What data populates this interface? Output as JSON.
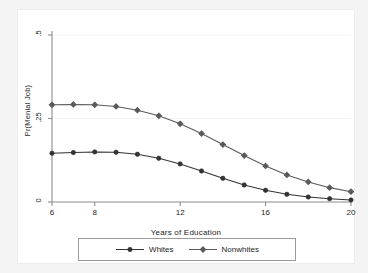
{
  "chart_data": {
    "type": "line",
    "title": "",
    "xlabel": "Years of Education",
    "ylabel": "Pr(Menial Job)",
    "xlim": [
      6,
      20
    ],
    "ylim": [
      0,
      0.5
    ],
    "xticks": [
      6,
      8,
      12,
      16,
      20
    ],
    "xticklabels": [
      "6",
      "8",
      "12",
      "16",
      "20"
    ],
    "yticks": [
      0,
      0.25,
      0.5
    ],
    "yticklabels": [
      "0",
      ".25",
      ".5"
    ],
    "grid": "horizontal-faint",
    "legend_position": "below-center",
    "x": [
      6,
      7,
      8,
      9,
      10,
      11,
      12,
      13,
      14,
      15,
      16,
      17,
      18,
      19,
      20
    ],
    "series": [
      {
        "name": "Whites",
        "marker": "filled-circle",
        "color": "#333333",
        "values": [
          0.146,
          0.148,
          0.15,
          0.149,
          0.143,
          0.131,
          0.114,
          0.093,
          0.071,
          0.051,
          0.035,
          0.023,
          0.015,
          0.01,
          0.006
        ]
      },
      {
        "name": "Nonwhites",
        "marker": "filled-diamond",
        "color": "#5a5a5a",
        "values": [
          0.291,
          0.292,
          0.291,
          0.286,
          0.275,
          0.258,
          0.234,
          0.205,
          0.172,
          0.139,
          0.108,
          0.081,
          0.06,
          0.043,
          0.031
        ]
      }
    ]
  },
  "axes": {
    "y_title": "Pr(Menial Job)",
    "x_title": "Years of Education",
    "y_tick_top": ".5",
    "y_tick_mid": ".25",
    "y_tick_bottom": "0",
    "x_tick_1": "6",
    "x_tick_2": "8",
    "x_tick_3": "12",
    "x_tick_4": "16",
    "x_tick_5": "20"
  },
  "legend": {
    "items": [
      {
        "label": "Whites"
      },
      {
        "label": "Nonwhites"
      }
    ]
  },
  "colors": {
    "whites": "#333333",
    "nonwhites": "#5a5a5a",
    "axis": "#8c8c8c",
    "grid": "#f2f2f2"
  }
}
